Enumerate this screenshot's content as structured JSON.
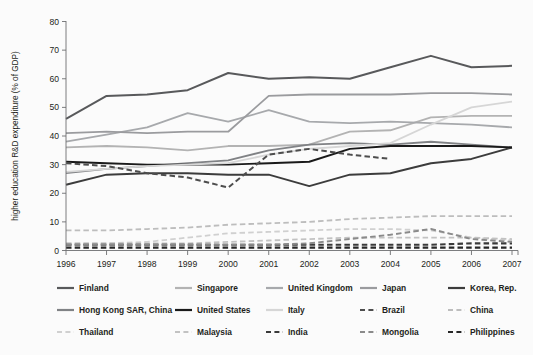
{
  "chart_data": {
    "type": "line",
    "title": "",
    "xlabel": "",
    "ylabel": "higher education R&D expenditure (% of GDP)",
    "x": [
      1996,
      1997,
      1998,
      1999,
      2000,
      2001,
      2002,
      2003,
      2004,
      2005,
      2006,
      2007
    ],
    "categories": [
      "1996",
      "1997",
      "1998",
      "1999",
      "2000",
      "2001",
      "2002",
      "2003",
      "2004",
      "2005",
      "2006",
      "2007"
    ],
    "xlim": [
      1996,
      2007
    ],
    "ylim": [
      0,
      80
    ],
    "yticks": [
      0,
      10,
      20,
      30,
      40,
      50,
      60,
      70,
      80
    ],
    "grid": false,
    "legend_position": "bottom",
    "series": [
      {
        "name": "Finland",
        "color": "#58595b",
        "style": "solid",
        "width": 2.0,
        "values": [
          46.0,
          54.0,
          54.5,
          56.0,
          62.0,
          60.0,
          60.5,
          60.0,
          64.0,
          68.0,
          64.0,
          64.5
        ]
      },
      {
        "name": "Singapore",
        "color": "#b3b3b3",
        "style": "solid",
        "width": 1.8,
        "values": [
          36.0,
          36.5,
          36.0,
          35.0,
          36.5,
          36.5,
          37.0,
          41.5,
          42.0,
          46.5,
          47.0,
          47.0
        ]
      },
      {
        "name": "United Kingdom",
        "color": "#a7a9ac",
        "style": "solid",
        "width": 1.8,
        "values": [
          38.0,
          40.5,
          43.0,
          48.0,
          45.0,
          49.0,
          45.0,
          44.5,
          45.0,
          44.5,
          44.0,
          43.0
        ]
      },
      {
        "name": "Japan",
        "color": "#9a9b9e",
        "style": "solid",
        "width": 1.8,
        "values": [
          41.0,
          41.5,
          41.0,
          41.5,
          41.5,
          54.0,
          54.5,
          54.5,
          54.5,
          55.0,
          55.0,
          54.5
        ]
      },
      {
        "name": "Korea, Rep.",
        "color": "#3c3c3c",
        "style": "solid",
        "width": 2.0,
        "values": [
          23.0,
          26.5,
          27.0,
          27.0,
          26.5,
          26.5,
          22.5,
          26.5,
          27.0,
          30.5,
          32.0,
          36.0
        ]
      },
      {
        "name": "Hong Kong SAR, China",
        "color": "#808285",
        "style": "solid",
        "width": 1.8,
        "values": [
          27.0,
          28.5,
          29.5,
          30.5,
          31.5,
          35.0,
          37.0,
          37.5,
          37.0,
          38.0,
          37.0,
          36.0
        ]
      },
      {
        "name": "United States",
        "color": "#1a1a1a",
        "style": "solid",
        "width": 1.9,
        "values": [
          31.0,
          30.5,
          30.0,
          30.0,
          30.0,
          30.5,
          31.0,
          35.5,
          36.5,
          36.5,
          36.5,
          36.0
        ]
      },
      {
        "name": "Italy",
        "color": "#d6d6d6",
        "style": "solid",
        "width": 1.8,
        "values": [
          27.5,
          28.5,
          29.5,
          30.0,
          30.5,
          33.5,
          35.5,
          36.5,
          37.5,
          44.0,
          50.0,
          52.0
        ]
      },
      {
        "name": "Brazil",
        "color": "#4d4d4d",
        "style": "dashed",
        "width": 2.0,
        "values": [
          30.5,
          29.5,
          27.0,
          25.5,
          22.0,
          33.5,
          35.5,
          33.5,
          32.0,
          null,
          null,
          null
        ]
      },
      {
        "name": "China",
        "color": "#bdbdbd",
        "style": "dashed",
        "width": 1.8,
        "values": [
          7.0,
          7.0,
          7.5,
          8.0,
          9.0,
          9.5,
          10.0,
          11.0,
          11.5,
          12.0,
          12.0,
          12.0
        ]
      },
      {
        "name": "Thailand",
        "color": "#d0d0d0",
        "style": "dashed",
        "width": 1.8,
        "values": [
          2.5,
          2.5,
          3.0,
          4.5,
          6.0,
          6.5,
          7.0,
          7.5,
          7.5,
          7.0,
          4.5,
          3.5
        ]
      },
      {
        "name": "Malaysia",
        "color": "#c2c2c2",
        "style": "dashed",
        "width": 1.8,
        "values": [
          2.5,
          2.5,
          2.5,
          2.5,
          3.0,
          3.5,
          4.0,
          4.5,
          4.5,
          4.5,
          4.5,
          4.0
        ]
      },
      {
        "name": "India",
        "color": "#3a3a3a",
        "style": "dashed",
        "width": 2.1,
        "values": [
          2.0,
          2.0,
          2.0,
          2.0,
          2.0,
          2.0,
          2.0,
          2.0,
          2.0,
          2.0,
          2.5,
          2.5
        ]
      },
      {
        "name": "Mongolia",
        "color": "#8a8a8a",
        "style": "dashed",
        "width": 1.9,
        "values": [
          2.0,
          2.0,
          2.0,
          2.0,
          2.0,
          2.0,
          2.5,
          4.0,
          5.5,
          7.5,
          4.0,
          3.0
        ]
      },
      {
        "name": "Philippines",
        "color": "#262626",
        "style": "dashed",
        "width": 2.1,
        "values": [
          1.0,
          1.0,
          1.0,
          1.0,
          1.0,
          1.0,
          1.0,
          1.0,
          1.0,
          1.0,
          1.0,
          1.0
        ]
      }
    ]
  },
  "axis": {
    "y_label": "higher education R&D expenditure (% of GDP)",
    "y_ticks": [
      "0",
      "10",
      "20",
      "30",
      "40",
      "50",
      "60",
      "70",
      "80"
    ],
    "x_ticks": [
      "1996",
      "1997",
      "1998",
      "1999",
      "2000",
      "2001",
      "2002",
      "2003",
      "2004",
      "2005",
      "2006",
      "2007"
    ]
  },
  "legend": {
    "rows": [
      [
        {
          "label": "Finland",
          "color": "#58595b",
          "style": "solid"
        },
        {
          "label": "Singapore",
          "color": "#b3b3b3",
          "style": "solid"
        },
        {
          "label": "United Kingdom",
          "color": "#a7a9ac",
          "style": "solid"
        },
        {
          "label": "Japan",
          "color": "#9a9b9e",
          "style": "solid"
        },
        {
          "label": "Korea, Rep.",
          "color": "#3c3c3c",
          "style": "solid"
        }
      ],
      [
        {
          "label": "Hong Kong SAR, China",
          "color": "#808285",
          "style": "solid"
        },
        {
          "label": "United States",
          "color": "#1a1a1a",
          "style": "solid"
        },
        {
          "label": "Italy",
          "color": "#d6d6d6",
          "style": "solid"
        },
        {
          "label": "Brazil",
          "color": "#4d4d4d",
          "style": "dashed"
        },
        {
          "label": "China",
          "color": "#bdbdbd",
          "style": "dashed"
        }
      ],
      [
        {
          "label": "Thailand",
          "color": "#d0d0d0",
          "style": "dashed"
        },
        {
          "label": "Malaysia",
          "color": "#c2c2c2",
          "style": "dashed"
        },
        {
          "label": "India",
          "color": "#3a3a3a",
          "style": "dashed"
        },
        {
          "label": "Mongolia",
          "color": "#8a8a8a",
          "style": "dashed"
        },
        {
          "label": "Philippines",
          "color": "#262626",
          "style": "dashed"
        }
      ]
    ]
  }
}
